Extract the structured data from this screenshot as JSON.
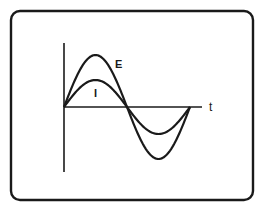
{
  "figure": {
    "frame": {
      "x": 11,
      "y": 11,
      "width": 242,
      "height": 189,
      "radius": 9,
      "stroke": "#1a1a1a"
    },
    "axes": {
      "origin": {
        "x": 64,
        "y": 107
      },
      "y_axis_top": 43,
      "y_axis_bottom": 172,
      "x_axis_end": 202,
      "x_label": "t"
    },
    "curves": [
      {
        "name": "E",
        "label": "E",
        "amplitude": 52,
        "label_pos": {
          "x": 115,
          "y": 68
        }
      },
      {
        "name": "I",
        "label": "I",
        "amplitude": 27,
        "label_pos": {
          "x": 94,
          "y": 97
        }
      }
    ],
    "period_px": 126,
    "color": "#1a1a1a"
  },
  "chart_data": {
    "type": "line",
    "title": "",
    "xlabel": "t",
    "ylabel": "",
    "x": [
      0,
      45,
      90,
      135,
      180,
      225,
      270,
      315,
      360
    ],
    "series": [
      {
        "name": "E",
        "values": [
          0,
          0.71,
          1.0,
          0.71,
          0,
          -0.71,
          -1.0,
          -0.71,
          0
        ]
      },
      {
        "name": "I",
        "values": [
          0,
          0.37,
          0.52,
          0.37,
          0,
          -0.37,
          -0.52,
          -0.37,
          0
        ]
      }
    ],
    "grid": false,
    "legend": "inline labels"
  }
}
